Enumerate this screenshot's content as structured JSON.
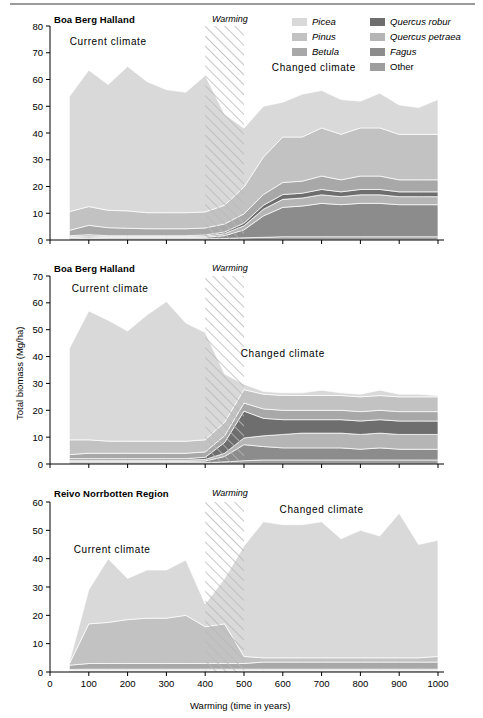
{
  "figure": {
    "width": 483,
    "height": 718,
    "xlabel": "Warming (time in years)",
    "ylabel": "Total biomass (Mg/ha)",
    "warming_label": "Warming",
    "current_label": "Current climate",
    "changed_label": "Changed climate"
  },
  "legend": {
    "position": "top-right",
    "entries": [
      {
        "label": "Picea",
        "color": "#d9d9d9",
        "italic": true
      },
      {
        "label": "Pinus",
        "color": "#c2c2c2",
        "italic": true
      },
      {
        "label": "Betula",
        "color": "#a8a8a8",
        "italic": true
      },
      {
        "label": "Quercus robur",
        "color": "#6e6e6e",
        "italic": true
      },
      {
        "label": "Quercus petraea",
        "color": "#b5b5b5",
        "italic": true
      },
      {
        "label": "Fagus",
        "color": "#8c8c8c",
        "italic": true
      },
      {
        "label": "Other",
        "color": "#9e9e9e",
        "italic": false
      }
    ]
  },
  "chart_data": {
    "type": "area",
    "xlabel": "Warming (time in years)",
    "ylabel": "Total biomass (Mg/ha)",
    "xlim": [
      0,
      1000
    ],
    "xticks": [
      0,
      100,
      200,
      300,
      400,
      500,
      600,
      700,
      800,
      900,
      1000
    ],
    "grid": false,
    "stacked": true,
    "warming_band": [
      400,
      500
    ],
    "series_order": [
      "Other",
      "Fagus",
      "Quercus petraea",
      "Quercus robur",
      "Betula",
      "Pinus",
      "Picea"
    ],
    "panels": [
      {
        "title": "Boa Berg Halland",
        "ylim": [
          0,
          80
        ],
        "yticks": [
          0,
          10,
          20,
          30,
          40,
          50,
          60,
          70,
          80
        ],
        "current_label_pos": [
          150,
          73
        ],
        "changed_label_pos": [
          680,
          63
        ],
        "x": [
          50,
          100,
          150,
          200,
          250,
          300,
          350,
          400,
          450,
          500,
          550,
          600,
          650,
          700,
          750,
          800,
          850,
          900,
          950,
          1000
        ],
        "series": [
          {
            "name": "Other",
            "values": [
              0.5,
              0.6,
              0.5,
              0.5,
              0.5,
              0.5,
              0.5,
              0.5,
              0.6,
              0.8,
              1.0,
              1.2,
              1.2,
              1.2,
              1.2,
              1.2,
              1.2,
              1.2,
              1.2,
              1.2
            ]
          },
          {
            "name": "Fagus",
            "values": [
              0.4,
              0.5,
              0.4,
              0.4,
              0.4,
              0.4,
              0.4,
              0.5,
              1.0,
              3.0,
              8.0,
              11.0,
              11.5,
              12.5,
              12.0,
              12.5,
              12.5,
              12.0,
              12.0,
              12.0
            ]
          },
          {
            "name": "Quercus petraea",
            "values": [
              0.4,
              0.5,
              0.4,
              0.4,
              0.4,
              0.4,
              0.4,
              0.5,
              0.8,
              1.5,
              2.5,
              3.0,
              3.0,
              3.2,
              3.0,
              3.2,
              3.2,
              3.0,
              3.0,
              3.0
            ]
          },
          {
            "name": "Quercus robur",
            "values": [
              0.3,
              0.4,
              0.3,
              0.3,
              0.3,
              0.3,
              0.3,
              0.4,
              0.6,
              1.0,
              1.5,
              1.8,
              1.8,
              2.0,
              1.8,
              2.0,
              2.0,
              1.8,
              1.8,
              1.8
            ]
          },
          {
            "name": "Betula",
            "values": [
              2.0,
              3.5,
              3.0,
              2.8,
              2.6,
              2.6,
              2.6,
              2.6,
              3.0,
              3.5,
              4.0,
              4.5,
              4.5,
              5.0,
              4.5,
              5.0,
              5.0,
              4.5,
              4.5,
              4.5
            ]
          },
          {
            "name": "Pinus",
            "values": [
              7.0,
              7.0,
              6.5,
              6.5,
              6.0,
              6.0,
              6.0,
              6.0,
              7.0,
              10.0,
              14.0,
              17.0,
              16.5,
              18.0,
              17.0,
              18.0,
              18.0,
              17.0,
              17.0,
              17.0
            ]
          },
          {
            "name": "Picea",
            "values": [
              43.0,
              51.0,
              47.0,
              54.0,
              49.0,
              46.0,
              45.0,
              51.0,
              34.0,
              22.0,
              19.0,
              13.0,
              16.0,
              14.0,
              13.0,
              10.0,
              13.0,
              11.0,
              10.0,
              13.0
            ]
          }
        ],
        "totals": [
          53.6,
          63.5,
          58.1,
          64.9,
          59.2,
          56.2,
          55.2,
          61.5,
          47.0,
          41.8,
          50.0,
          51.5,
          54.5,
          55.9,
          52.5,
          51.9,
          54.9,
          50.5,
          49.5,
          52.5
        ]
      },
      {
        "title": "Boa Berg Halland",
        "ylim": [
          0,
          70
        ],
        "yticks": [
          0,
          10,
          20,
          30,
          40,
          50,
          60,
          70
        ],
        "current_label_pos": [
          155,
          64
        ],
        "changed_label_pos": [
          600,
          40
        ],
        "x": [
          50,
          100,
          150,
          200,
          250,
          300,
          350,
          400,
          450,
          500,
          550,
          600,
          650,
          700,
          750,
          800,
          850,
          900,
          950,
          1000
        ],
        "series": [
          {
            "name": "Other",
            "values": [
              0.5,
              0.5,
              0.5,
              0.5,
              0.5,
              0.5,
              0.5,
              0.5,
              0.8,
              1.2,
              1.5,
              1.5,
              1.5,
              1.5,
              1.5,
              1.5,
              1.5,
              1.5,
              1.5,
              1.5
            ]
          },
          {
            "name": "Fagus",
            "values": [
              0.5,
              0.5,
              0.5,
              0.5,
              0.5,
              0.5,
              0.5,
              0.6,
              2.0,
              6.0,
              5.0,
              4.5,
              4.5,
              4.5,
              4.5,
              4.0,
              4.5,
              4.0,
              4.0,
              4.0
            ]
          },
          {
            "name": "Quercus petraea",
            "values": [
              0.5,
              0.5,
              0.5,
              0.5,
              0.5,
              0.5,
              0.5,
              0.6,
              1.2,
              2.5,
              4.0,
              5.0,
              5.5,
              5.5,
              5.5,
              5.5,
              5.5,
              5.5,
              5.5,
              5.5
            ]
          },
          {
            "name": "Quercus robur",
            "values": [
              0.5,
              0.5,
              0.5,
              0.5,
              0.5,
              0.5,
              0.5,
              0.8,
              4.0,
              10.0,
              6.5,
              5.5,
              5.0,
              5.0,
              5.0,
              5.0,
              5.0,
              5.0,
              5.0,
              5.0
            ]
          },
          {
            "name": "Betula",
            "values": [
              1.5,
              2.0,
              2.0,
              2.0,
              2.0,
              2.0,
              2.0,
              2.0,
              2.5,
              3.0,
              3.5,
              3.5,
              3.5,
              3.5,
              3.5,
              3.5,
              3.5,
              3.5,
              3.5,
              3.5
            ]
          },
          {
            "name": "Pinus",
            "values": [
              5.5,
              5.0,
              4.5,
              4.5,
              4.5,
              4.5,
              4.5,
              4.5,
              5.0,
              5.0,
              5.5,
              5.5,
              5.5,
              5.5,
              5.5,
              5.5,
              5.5,
              5.5,
              5.5,
              5.5
            ]
          },
          {
            "name": "Picea",
            "values": [
              34.0,
              48.0,
              45.0,
              41.0,
              47.0,
              52.0,
              44.0,
              40.0,
              18.0,
              2.0,
              1.0,
              1.0,
              1.0,
              2.0,
              1.0,
              1.0,
              2.0,
              1.0,
              1.0,
              0.5
            ]
          }
        ],
        "totals": [
          43.0,
          57.0,
          53.5,
          49.5,
          55.5,
          60.5,
          52.5,
          49.0,
          33.5,
          29.7,
          27.0,
          26.5,
          26.5,
          27.5,
          26.5,
          26.0,
          27.5,
          26.0,
          26.0,
          25.5
        ]
      },
      {
        "title": "Reivo Norrbotten Region",
        "ylim": [
          0,
          60
        ],
        "yticks": [
          0,
          10,
          20,
          30,
          40,
          50,
          60
        ],
        "current_label_pos": [
          160,
          42
        ],
        "changed_label_pos": [
          700,
          56
        ],
        "x": [
          50,
          100,
          150,
          200,
          250,
          300,
          350,
          400,
          450,
          500,
          550,
          600,
          650,
          700,
          750,
          800,
          850,
          900,
          950,
          1000
        ],
        "series": [
          {
            "name": "Other",
            "values": [
              0.3,
              0.4,
              0.4,
              0.4,
              0.4,
              0.4,
              0.4,
              0.4,
              0.4,
              0.4,
              0.4,
              0.4,
              0.4,
              0.4,
              0.4,
              0.4,
              0.4,
              0.4,
              0.4,
              0.4
            ]
          },
          {
            "name": "Fagus",
            "values": [
              0.2,
              0.2,
              0.2,
              0.2,
              0.2,
              0.2,
              0.2,
              0.2,
              0.2,
              0.2,
              0.2,
              0.2,
              0.2,
              0.2,
              0.2,
              0.2,
              0.2,
              0.2,
              0.2,
              0.2
            ]
          },
          {
            "name": "Quercus petraea",
            "values": [
              0.2,
              0.2,
              0.2,
              0.2,
              0.2,
              0.2,
              0.2,
              0.2,
              0.2,
              0.2,
              0.2,
              0.2,
              0.2,
              0.2,
              0.2,
              0.2,
              0.2,
              0.2,
              0.2,
              0.2
            ]
          },
          {
            "name": "Quercus robur",
            "values": [
              0.2,
              0.2,
              0.2,
              0.2,
              0.2,
              0.2,
              0.2,
              0.2,
              0.2,
              0.2,
              0.2,
              0.2,
              0.2,
              0.2,
              0.2,
              0.2,
              0.2,
              0.2,
              0.2,
              0.2
            ]
          },
          {
            "name": "Betula",
            "values": [
              1.5,
              2.0,
              2.0,
              2.0,
              2.0,
              2.0,
              2.0,
              2.0,
              2.0,
              2.0,
              2.5,
              2.5,
              2.5,
              2.5,
              2.5,
              2.5,
              2.5,
              2.5,
              2.5,
              2.5
            ]
          },
          {
            "name": "Pinus",
            "values": [
              0.5,
              14.0,
              14.5,
              15.5,
              16.0,
              16.0,
              17.0,
              13.0,
              14.0,
              2.5,
              1.5,
              1.5,
              1.5,
              1.5,
              1.5,
              1.5,
              1.5,
              1.5,
              1.5,
              2.0
            ]
          },
          {
            "name": "Picea",
            "values": [
              0.5,
              12.0,
              22.5,
              14.5,
              17.0,
              17.0,
              19.5,
              8.0,
              16.0,
              39.0,
              48.0,
              47.0,
              47.0,
              48.0,
              42.0,
              45.0,
              43.0,
              51.0,
              40.0,
              41.0
            ]
          }
        ],
        "totals": [
          3.4,
          29.0,
          40.0,
          33.0,
          36.0,
          36.0,
          39.5,
          24.0,
          33.0,
          44.5,
          53.0,
          52.0,
          52.0,
          53.0,
          47.0,
          50.0,
          48.0,
          56.0,
          45.0,
          46.5
        ]
      }
    ]
  }
}
